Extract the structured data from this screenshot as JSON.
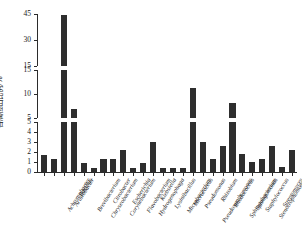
{
  "chart_data": {
    "type": "bar",
    "title": "",
    "subtitle": "",
    "xlabel": "",
    "ylabel": "各属检出比例/%",
    "grid": false,
    "legend": null,
    "broken_axis": true,
    "axis_segments": [
      {
        "name": "lower",
        "range": [
          0,
          5
        ],
        "ticks": [
          0,
          1,
          2,
          3,
          4,
          5
        ]
      },
      {
        "name": "middle",
        "range": [
          5,
          15
        ],
        "ticks": [
          5,
          10,
          15
        ]
      },
      {
        "name": "upper",
        "range": [
          15,
          45
        ],
        "ticks": [
          15,
          30,
          45
        ]
      }
    ],
    "ylim": [
      0,
      45
    ],
    "tick_labels_y": [
      "0",
      "1",
      "2",
      "3",
      "4",
      "5",
      "5",
      "10",
      "15",
      "15",
      "30",
      "45"
    ],
    "categories": [
      "Achromobacter",
      "Arthrobacter",
      "Bacillus",
      "Brevibacterium",
      "Chryseobacterium",
      "Citrobacter",
      "Corynebacterium",
      "Escherichia",
      "Flavobacterium",
      "Hydrogenophaga",
      "Klebsiella",
      "Lysinibacillus",
      "Microbacterium",
      "Micrococcus",
      "Pseudomonas",
      "Pseudoxanthomonas",
      "Rhizobium",
      "Rhodococcus",
      "Sphingobacterium",
      "Sphingomonas",
      "Staphylococcus",
      "Stenotrophomonas",
      "Streptomyces"
    ],
    "values": [
      1.7,
      1.3,
      44.5,
      6.8,
      0.9,
      0.45,
      1.3,
      1.3,
      2.2,
      0.45,
      0.9,
      3.0,
      0.45,
      0.45,
      0.45,
      11.3,
      3.0,
      1.35,
      2.6,
      8.1,
      1.8,
      1.0,
      1.35
    ],
    "extra_values": [
      2.6,
      0.5,
      2.2
    ],
    "bar_color": "#2e2e2e",
    "axis_color": "#2b2b2b",
    "background": "#ffffff"
  }
}
